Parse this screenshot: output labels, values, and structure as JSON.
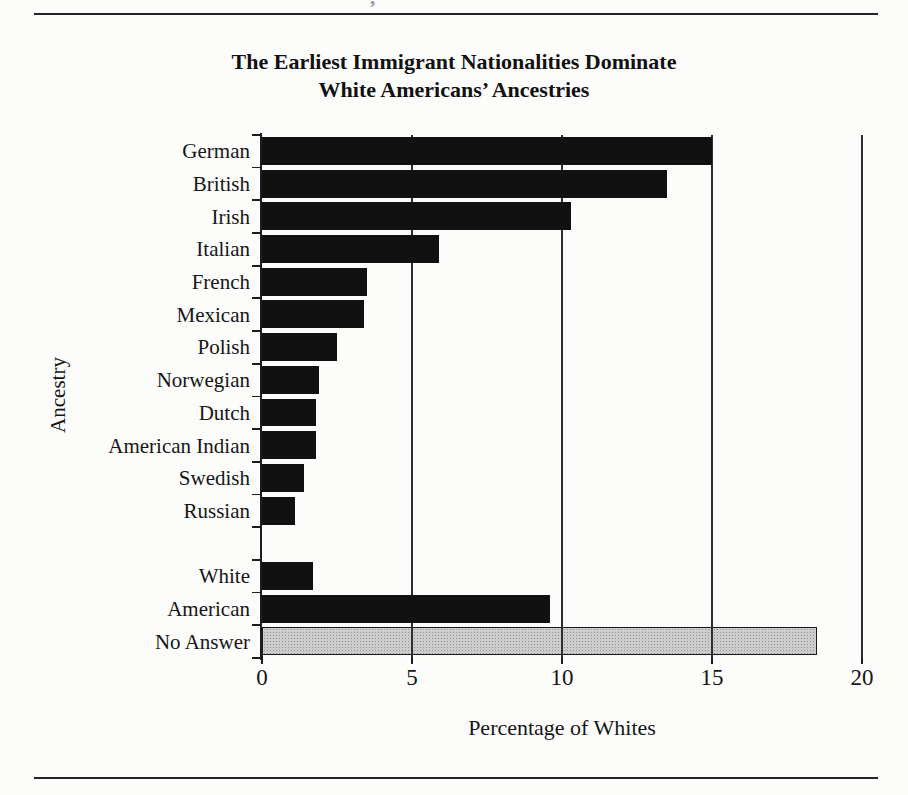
{
  "page": {
    "cropped_text_fragment": ",",
    "title_line1": "The Earliest Immigrant Nationalities Dominate",
    "title_line2": "White Americans’ Ancestries"
  },
  "chart_data": {
    "type": "bar",
    "orientation": "horizontal",
    "title": "The Earliest Immigrant Nationalities Dominate White Americans’ Ancestries",
    "xlabel": "Percentage of Whites",
    "ylabel": "Ancestry",
    "xlim": [
      0,
      20
    ],
    "xticks": [
      0,
      5,
      10,
      15,
      20
    ],
    "gridline_values": [
      5,
      10,
      15,
      20
    ],
    "grid": "vertical gridlines at 5, 10, 15 and 20; blank spacer row between Russian and White",
    "categories": [
      "German",
      "British",
      "Irish",
      "Italian",
      "French",
      "Mexican",
      "Polish",
      "Norwegian",
      "Dutch",
      "American Indian",
      "Swedish",
      "Russian",
      "",
      "White",
      "American",
      "No Answer"
    ],
    "values": [
      15.0,
      13.5,
      10.3,
      5.9,
      3.5,
      3.4,
      2.5,
      1.9,
      1.8,
      1.8,
      1.4,
      1.1,
      null,
      1.7,
      9.6,
      18.5
    ],
    "bar_style_by_category": {
      "default": "solid black",
      "No Answer": "light gray stipple with black outline"
    },
    "colors": {
      "bar": "#111111",
      "no_answer_fill": "#cdcdcd",
      "axis": "#1d1d1d",
      "rule": "#222222"
    }
  }
}
